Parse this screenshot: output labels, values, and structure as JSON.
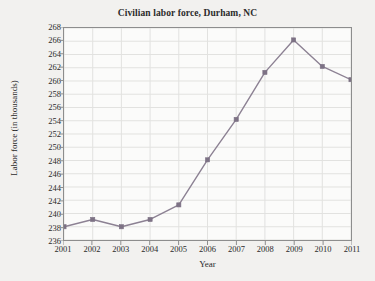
{
  "chart_data": {
    "type": "line",
    "title": "Civilian labor force, Durham, NC",
    "xlabel": "Year",
    "ylabel": "Labor force (in thousands)",
    "categories": [
      2001,
      2002,
      2003,
      2004,
      2005,
      2006,
      2007,
      2008,
      2009,
      2010,
      2011
    ],
    "x_tick_labels": [
      "2001",
      "2002",
      "2003",
      "2004",
      "2005",
      "2006",
      "2007",
      "2008",
      "2009",
      "2010",
      "2011"
    ],
    "values": [
      238.0,
      239.1,
      238.0,
      239.1,
      241.3,
      248.1,
      254.2,
      261.3,
      266.2,
      262.2,
      260.2
    ],
    "series": [
      {
        "name": "Civilian labor force",
        "values": [
          238.0,
          239.1,
          238.0,
          239.1,
          241.3,
          248.1,
          254.2,
          261.3,
          266.2,
          262.2,
          260.2
        ]
      }
    ],
    "y_tick_labels": [
      "236",
      "238",
      "240",
      "242",
      "244",
      "246",
      "248",
      "250",
      "252",
      "254",
      "256",
      "258",
      "260",
      "262",
      "264",
      "266",
      "268"
    ],
    "y_ticks": [
      236,
      238,
      240,
      242,
      244,
      246,
      248,
      250,
      252,
      254,
      256,
      258,
      260,
      262,
      264,
      266,
      268
    ],
    "ylim": [
      236,
      268
    ],
    "xlim": [
      2001,
      2011
    ],
    "grid": true,
    "legend": false,
    "legend_position": "none",
    "colors": {
      "line": "#8c8193",
      "marker": "#7d7285",
      "grid": "#e2e2e0",
      "axis": "#8d8d8d",
      "text": "#2b2b2b",
      "plot_background": "#fbfbfa",
      "page_background": "#f2f1ef"
    }
  }
}
